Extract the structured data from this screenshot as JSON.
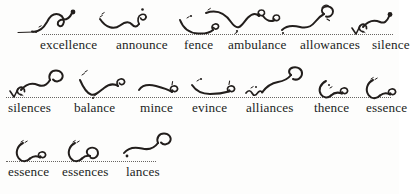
{
  "document": {
    "kind": "shorthand-practice-sheet",
    "ink_color": "#221e1c",
    "baseline_color": "#4d4a47",
    "page_color": "#fdfdfc",
    "rows": [
      {
        "index": 1,
        "entries": [
          {
            "word": "excellence",
            "x": 40,
            "outline_x": 48,
            "outline": "excellence"
          },
          {
            "word": "announce",
            "x": 116,
            "outline_x": 126,
            "outline": "announce"
          },
          {
            "word": "fence",
            "x": 184,
            "outline_x": 186,
            "outline": "fence"
          },
          {
            "word": "ambulance",
            "x": 228,
            "outline_x": 232,
            "outline": "ambulance"
          },
          {
            "word": "allowances",
            "x": 300,
            "outline_x": 300,
            "outline": "allowances"
          },
          {
            "word": "silence",
            "x": 372,
            "outline_x": 372,
            "outline": "silence"
          }
        ]
      },
      {
        "index": 2,
        "entries": [
          {
            "word": "silences",
            "x": 8,
            "outline_x": 12,
            "outline": "silences"
          },
          {
            "word": "balance",
            "x": 74,
            "outline_x": 82,
            "outline": "balance"
          },
          {
            "word": "mince",
            "x": 140,
            "outline_x": 140,
            "outline": "mince"
          },
          {
            "word": "evince",
            "x": 192,
            "outline_x": 192,
            "outline": "evince"
          },
          {
            "word": "alliances",
            "x": 246,
            "outline_x": 246,
            "outline": "alliances"
          },
          {
            "word": "thence",
            "x": 314,
            "outline_x": 318,
            "outline": "thence"
          },
          {
            "word": "essence",
            "x": 366,
            "outline_x": 366,
            "outline": "essence"
          }
        ]
      },
      {
        "index": 3,
        "entries": [
          {
            "word": "essence",
            "x": 8,
            "outline_x": 16,
            "outline": "essence2"
          },
          {
            "word": "essences",
            "x": 62,
            "outline_x": 68,
            "outline": "essences"
          },
          {
            "word": "lances",
            "x": 126,
            "outline_x": 128,
            "outline": "lances"
          }
        ]
      }
    ]
  }
}
